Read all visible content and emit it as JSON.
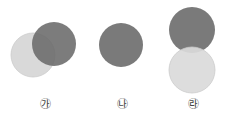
{
  "figures": [
    {
      "label": "㉮",
      "label_x": 45,
      "circles": [
        {
          "cx": 33,
          "cy": 55,
          "r": 22,
          "shade": "light"
        },
        {
          "cx": 54,
          "cy": 44,
          "r": 22,
          "shade": "dark"
        }
      ]
    },
    {
      "label": "㉯",
      "label_x": 122,
      "circles": [
        {
          "cx": 121,
          "cy": 45,
          "r": 22,
          "shade": "dark"
        }
      ]
    },
    {
      "label": "㉱",
      "label_x": 193,
      "circles": [
        {
          "cx": 192,
          "cy": 30,
          "r": 23,
          "shade": "dark"
        },
        {
          "cx": 192,
          "cy": 70,
          "r": 23,
          "shade": "light"
        }
      ]
    }
  ],
  "colors": {
    "dark": "#7a7a7a",
    "light": "#d9d9d9",
    "light_stroke": "#c8c8c8"
  }
}
